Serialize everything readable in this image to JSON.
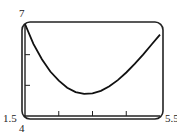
{
  "chart_data": {
    "type": "line",
    "title": "",
    "xlabel": "",
    "ylabel": "",
    "xlim": [
      1.5,
      5.5
    ],
    "ylim": [
      4,
      7
    ],
    "x_tick_labels": [
      "1.5",
      "5.5"
    ],
    "y_tick_labels": [
      "4",
      "7"
    ],
    "x_ticks": [
      2.5,
      3.5,
      4.5
    ],
    "y_ticks": [
      5,
      6
    ],
    "grid": false,
    "series": [
      {
        "name": "f(x)",
        "x": [
          1.5,
          1.75,
          2.0,
          2.25,
          2.5,
          2.75,
          3.0,
          3.25,
          3.5,
          3.75,
          4.0,
          4.25,
          4.5,
          4.75,
          5.0,
          5.25,
          5.5
        ],
        "y": [
          7.0,
          6.35,
          5.85,
          5.45,
          5.15,
          4.92,
          4.78,
          4.72,
          4.74,
          4.82,
          4.97,
          5.17,
          5.42,
          5.7,
          6.0,
          6.33,
          6.65
        ]
      }
    ]
  },
  "labels": {
    "ymax": "7",
    "xmin": "1.5",
    "ymin": "4",
    "xmax": "5.5"
  }
}
